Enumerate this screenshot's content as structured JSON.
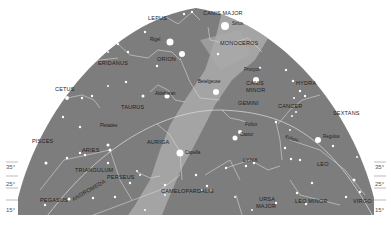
{
  "colors": {
    "sky": "#7d7d7d",
    "milky_way": "#a9a9a9",
    "lines": "#d6d6d6",
    "stars": "#ffffff",
    "text": "#1e1e1e",
    "background": "#ffffff"
  },
  "constellations": {
    "lepus": "LEPUS",
    "canis_major": "CANIS MAJOR",
    "monoceros": "MONOCEROS",
    "eridanus": "ERIDANUS",
    "orion": "ORION",
    "cetus": "CETUS",
    "taurus": "TAURUS",
    "canis_minor_1": "CANIS",
    "canis_minor_2": "MINOR",
    "hydra": "HYDRA",
    "gemini": "GEMINI",
    "cancer": "CANCER",
    "sextans": "SEXTANS",
    "pisces": "PISCES",
    "aries": "ARIES",
    "auriga": "AURIGA",
    "triangulum": "TRIANGULUM",
    "perseus": "PERSEUS",
    "lynx": "LYNX",
    "leo": "LEO",
    "pegasus": "PEGASUS",
    "andromeda": "ANDROMEDA",
    "camelopardalis": "CAMELOPARDALIS",
    "ursa_major_1": "URSA",
    "ursa_major_2": "MAJOR",
    "leo_minor": "LEO MINOR",
    "virgo": "VIRGO"
  },
  "stars": {
    "sirius": "Sirius",
    "rigel": "Rigel",
    "betelgeuse": "Betelgeuse",
    "procyon": "Procyon",
    "aldebaran": "Aldebaran",
    "pleiades": "Pleiades",
    "pollux": "Pollux",
    "castor": "Castor",
    "capella": "Capella",
    "regulus": "Regulus",
    "ecliptic": "Ecliptic"
  },
  "latitude_ticks": {
    "left": [
      "35°",
      "25°",
      "15°"
    ],
    "right": [
      "35°",
      "25°",
      "15°"
    ]
  }
}
